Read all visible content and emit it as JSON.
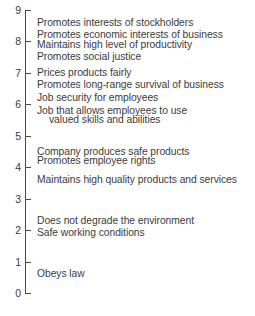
{
  "chart_data": {
    "type": "scatter",
    "title": "",
    "subtitle": "",
    "xlabel": "",
    "ylabel": "",
    "orientation": "vertical-scale",
    "grid": false,
    "legend": null,
    "ylim": [
      0,
      9
    ],
    "y_ticks": [
      0,
      1,
      2,
      3,
      4,
      5,
      6,
      7,
      8,
      9
    ],
    "y_tick_labels": [
      "0",
      "1",
      "2",
      "3",
      "4",
      "5",
      "6",
      "7",
      "8",
      "9"
    ],
    "axis_color": "#4a4a4a",
    "text_color": "#3b3b3b",
    "background_color": "#ffffff",
    "categories": [
      "Promotes interests of stockholders",
      "Promotes economic interests of business",
      "Maintains high level of productivity",
      "Promotes social justice",
      "Prices products fairly",
      "Promotes long-range survival of business",
      "Job security for employees",
      "Job that allows employees to use valued skills and abilities",
      "Company produces safe products",
      "Promotes employee rights",
      "Maintains high quality products and services",
      "Does not degrade the environment",
      "Safe working conditions",
      "Obeys law"
    ],
    "values": [
      8.6,
      8.2,
      7.9,
      7.5,
      7.0,
      6.6,
      6.2,
      5.8,
      4.5,
      4.2,
      3.6,
      2.3,
      1.9,
      0.6
    ],
    "items": [
      {
        "label": "Promotes interests of stockholders",
        "value": 8.6,
        "indent": false
      },
      {
        "label": "Promotes economic interests of business",
        "value": 8.2,
        "indent": false
      },
      {
        "label": "Maintains high level of productivity",
        "value": 7.9,
        "indent": false
      },
      {
        "label": "Promotes social justice",
        "value": 7.5,
        "indent": false
      },
      {
        "label": "Prices products fairly",
        "value": 7.0,
        "indent": false
      },
      {
        "label": "Promotes long-range survival of business",
        "value": 6.6,
        "indent": false
      },
      {
        "label": "Job security for employees",
        "value": 6.2,
        "indent": false
      },
      {
        "label": "Job that allows employees to use",
        "value": 5.8,
        "indent": false
      },
      {
        "label": "valued skills and abilities",
        "value": 5.5,
        "indent": true
      },
      {
        "label": "Company produces safe products",
        "value": 4.5,
        "indent": false
      },
      {
        "label": "Promotes employee rights",
        "value": 4.2,
        "indent": false
      },
      {
        "label": "Maintains high quality products and services",
        "value": 3.6,
        "indent": false
      },
      {
        "label": "Does not degrade the environment",
        "value": 2.3,
        "indent": false
      },
      {
        "label": "Safe working conditions",
        "value": 1.9,
        "indent": false
      },
      {
        "label": "Obeys law",
        "value": 0.6,
        "indent": false
      }
    ]
  }
}
